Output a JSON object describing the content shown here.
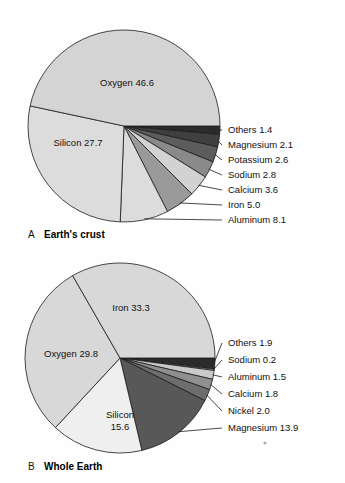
{
  "figure": {
    "background_color": "#fefefe",
    "outline_color": "#1a1a1a"
  },
  "charts": [
    {
      "id": "earths-crust",
      "caption_letter": "A",
      "caption_text": "Earth's crust",
      "center": {
        "x": 124,
        "y": 126
      },
      "radius": 96,
      "start_angle_deg": 0,
      "inside_labels": [
        {
          "name": "Oxygen",
          "value": "46.6",
          "text": "Oxygen  46.6",
          "x": 127,
          "y": 86
        },
        {
          "name": "Silicon",
          "value": "27.7",
          "text": "Silicon   27.7",
          "x": 78,
          "y": 146
        }
      ],
      "callouts": [
        {
          "name": "Others",
          "value": "1.4",
          "text": "Others   1.4",
          "x": 228,
          "y": 133,
          "anchor_x": 222,
          "anchor_y": 130
        },
        {
          "name": "Magnesium",
          "value": "2.1",
          "text": "Magnesium  2.1",
          "x": 228,
          "y": 148,
          "anchor_x": 222,
          "anchor_y": 145
        },
        {
          "name": "Potassium",
          "value": "2.6",
          "text": "Potassium  2.6",
          "x": 228,
          "y": 163,
          "anchor_x": 222,
          "anchor_y": 160
        },
        {
          "name": "Sodium",
          "value": "2.8",
          "text": "Sodium   2.8",
          "x": 228,
          "y": 178,
          "anchor_x": 222,
          "anchor_y": 175
        },
        {
          "name": "Calcium",
          "value": "3.6",
          "text": "Calcium   3.6",
          "x": 228,
          "y": 193,
          "anchor_x": 222,
          "anchor_y": 190
        },
        {
          "name": "Iron",
          "value": "5.0",
          "text": "Iron   5.0",
          "x": 228,
          "y": 208,
          "anchor_x": 222,
          "anchor_y": 205
        },
        {
          "name": "Aluminum",
          "value": "8.1",
          "text": "Aluminum   8.1",
          "x": 228,
          "y": 223,
          "anchor_x": 222,
          "anchor_y": 220
        }
      ]
    },
    {
      "id": "whole-earth",
      "caption_letter": "B",
      "caption_text": "Whole Earth",
      "center": {
        "x": 120,
        "y": 358
      },
      "radius": 95,
      "start_angle_deg": 0,
      "inside_labels": [
        {
          "name": "Iron",
          "value": "33.3",
          "text": "Iron   33.3",
          "x": 131,
          "y": 311
        },
        {
          "name": "Oxygen",
          "value": "29.8",
          "text": "Oxygen   29.8",
          "x": 71,
          "y": 357
        },
        {
          "name": "Silicon",
          "value": "15.6",
          "text": "Silicon",
          "x": 120,
          "y": 418
        },
        {
          "name": "Silicon-value",
          "value": "15.6",
          "text": "15.6",
          "x": 120,
          "y": 430
        }
      ],
      "callouts": [
        {
          "name": "Others",
          "value": "1.9",
          "text": "Others   1.9",
          "x": 228,
          "y": 346,
          "anchor_x": 222,
          "anchor_y": 343
        },
        {
          "name": "Sodium",
          "value": "0.2",
          "text": "Sodium   0.2",
          "x": 228,
          "y": 363,
          "anchor_x": 222,
          "anchor_y": 360
        },
        {
          "name": "Aluminum",
          "value": "1.5",
          "text": "Aluminum   1.5",
          "x": 228,
          "y": 380,
          "anchor_x": 222,
          "anchor_y": 377
        },
        {
          "name": "Calcium",
          "value": "1.8",
          "text": "Calcium   1.8",
          "x": 228,
          "y": 397,
          "anchor_x": 222,
          "anchor_y": 394
        },
        {
          "name": "Nickel",
          "value": "2.0",
          "text": "Nickel   2.0",
          "x": 228,
          "y": 414,
          "anchor_x": 222,
          "anchor_y": 411
        },
        {
          "name": "Magnesium",
          "value": "13.9",
          "text": "Magnesium   13.9",
          "x": 228,
          "y": 431,
          "anchor_x": 222,
          "anchor_y": 428
        }
      ]
    }
  ],
  "chart_data": [
    {
      "type": "pie",
      "title": "Earth's crust",
      "subtitle": "A",
      "unit": "percent by mass",
      "categories": [
        "Others",
        "Magnesium",
        "Potassium",
        "Sodium",
        "Calcium",
        "Iron",
        "Aluminum",
        "Silicon",
        "Oxygen"
      ],
      "values": [
        1.4,
        2.1,
        2.6,
        2.8,
        3.6,
        5.0,
        8.1,
        27.7,
        46.6
      ],
      "colors": [
        "#2b2b2b",
        "#3f3f3f",
        "#5c5c5c",
        "#8a8a8a",
        "#d2d2d2",
        "#9a9a9a",
        "#dcdcdc",
        "#dcdcdc",
        "#d4d4d4"
      ],
      "start_angle_deg": 0,
      "direction": "clockwise",
      "legend": "callout-labels-right",
      "grid": false
    },
    {
      "type": "pie",
      "title": "Whole Earth",
      "subtitle": "B",
      "unit": "percent by mass",
      "categories": [
        "Others",
        "Sodium",
        "Aluminum",
        "Calcium",
        "Nickel",
        "Magnesium",
        "Silicon",
        "Oxygen",
        "Iron"
      ],
      "values": [
        1.9,
        0.2,
        1.5,
        1.8,
        2.0,
        13.9,
        15.6,
        29.8,
        33.3
      ],
      "colors": [
        "#2b2b2b",
        "#f2f2f2",
        "#c9c9c9",
        "#8f8f8f",
        "#6e6e6e",
        "#585858",
        "#efefef",
        "#d8d8d8",
        "#d8d8d8"
      ],
      "start_angle_deg": 0,
      "direction": "clockwise",
      "legend": "callout-labels-right",
      "grid": false
    }
  ]
}
